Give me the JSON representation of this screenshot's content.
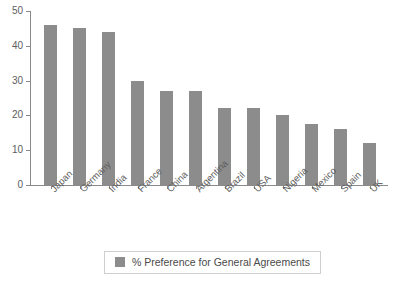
{
  "chart_data": {
    "type": "bar",
    "title": "",
    "subtitle": "",
    "xlabel": "",
    "ylabel": "",
    "categories": [
      "Japan",
      "Germany",
      "India",
      "France",
      "China",
      "Argentina",
      "Brazil",
      "USA",
      "Nigeria",
      "Mexico",
      "Spain",
      "UK"
    ],
    "values": [
      46,
      45,
      44,
      30,
      27,
      27,
      22,
      22,
      20,
      17.5,
      16,
      12
    ],
    "series": [
      {
        "name": "% Preference for General Agreements",
        "values": [
          46,
          45,
          44,
          30,
          27,
          27,
          22,
          22,
          20,
          17.5,
          16,
          12
        ],
        "color": "#8c8c8c"
      }
    ],
    "ylim": [
      0,
      50
    ],
    "yticks": [
      0,
      10,
      20,
      30,
      40,
      50
    ],
    "ytick_labels": [
      "0",
      "10",
      "20",
      "30",
      "40",
      "50"
    ],
    "grid": false,
    "legend": {
      "position": "bottom",
      "entries": [
        {
          "label": "% Preference for General Agreements",
          "color": "#8c8c8c"
        }
      ]
    },
    "axis_color": "#8a8a8a",
    "background": "#ffffff"
  }
}
